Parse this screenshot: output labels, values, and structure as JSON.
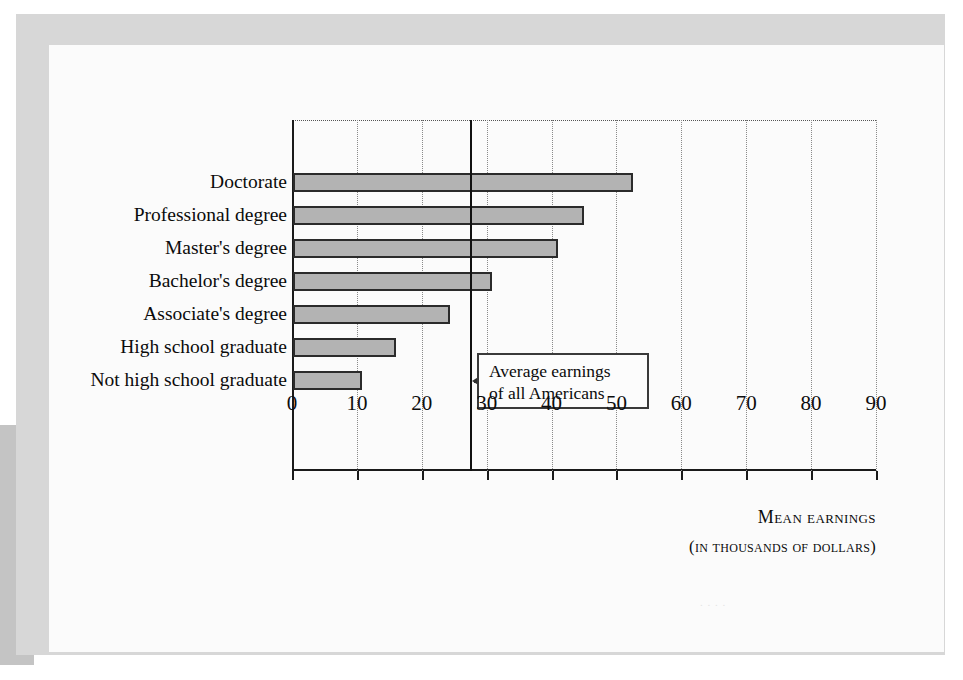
{
  "page": {
    "background_color": "#ffffff",
    "frame_color": "#d7d7d7",
    "sheet_color": "#fbfbfb",
    "shadow_color": "#c4c4c4",
    "ghost_text": "  .  .      .  ."
  },
  "chart_data": {
    "type": "bar",
    "orientation": "horizontal",
    "title": "",
    "xlabel": "Mean earnings",
    "xlabel_sub": "(in thousands of dollars)",
    "ylabel": "",
    "xlim": [
      0,
      90
    ],
    "xticks": [
      0,
      10,
      20,
      30,
      40,
      50,
      60,
      70,
      80,
      90
    ],
    "xtick_labels": [
      "0",
      "10",
      "20",
      "30",
      "40",
      "50",
      "60",
      "70",
      "80",
      "90"
    ],
    "grid": "vertical-dotted",
    "legend": "none",
    "bar_fill_color": "#b3b3b3",
    "bar_edge_color": "#2b2b2b",
    "categories": [
      "Doctorate",
      "Professional degree",
      "Master's degree",
      "Bachelor's degree",
      "Associate's degree",
      "High school graduate",
      "Not high school graduate"
    ],
    "values": [
      52.4,
      44.8,
      40.8,
      30.7,
      24.2,
      15.8,
      10.6
    ],
    "annotations": [
      {
        "type": "reference-line",
        "axis": "x",
        "value": 27.4,
        "label_line1": "Average earnings",
        "label_line2": "of all Americans",
        "arrow": "left"
      }
    ]
  }
}
